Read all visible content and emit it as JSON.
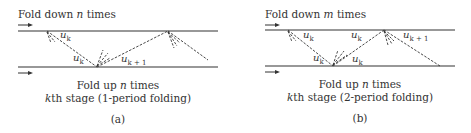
{
  "panels": [
    {
      "id": "a",
      "title_prefix": "Fold down ",
      "title_var": "n",
      "title_suffix": " times",
      "bottom_prefix": "Fold up ",
      "bottom_var": "n",
      "bottom_suffix": " times",
      "stage_var": "k",
      "stage_text": "th stage (1-period folding)",
      "caption": "(a)",
      "labels": [
        {
          "base": "u",
          "sub": "k"
        },
        {
          "base": "u",
          "sub": "k"
        },
        {
          "base": "u",
          "sub": "k + 1"
        }
      ]
    },
    {
      "id": "b",
      "title_prefix": "Fold down ",
      "title_var": "m",
      "title_suffix": " times",
      "bottom_prefix": "Fold up ",
      "bottom_var": "n",
      "bottom_suffix": " times",
      "stage_var": "k",
      "stage_text": "th stage (2-period folding)",
      "caption": "(b)",
      "labels": [
        {
          "base": "u",
          "sub": "k"
        },
        {
          "base": "u",
          "sub": "k"
        },
        {
          "base": "u",
          "sub": "k"
        },
        {
          "base": "u",
          "sub": "k"
        },
        {
          "base": "u",
          "sub": "k + 1"
        }
      ]
    }
  ]
}
